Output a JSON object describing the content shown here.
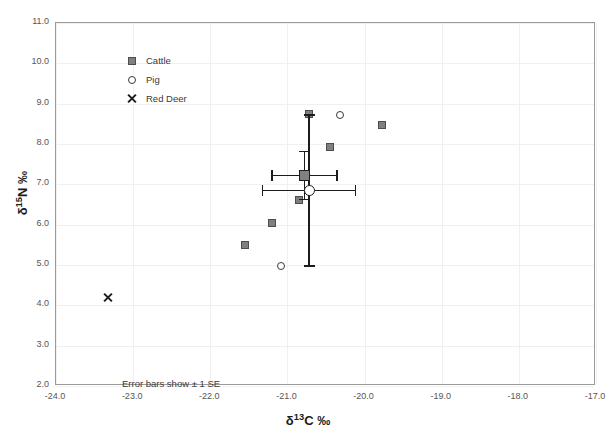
{
  "chart_data": {
    "type": "scatter",
    "title": "",
    "xlabel": "δ¹³C ‰",
    "ylabel": "δ¹⁵N ‰",
    "xlim": [
      -24.0,
      -17.0
    ],
    "ylim": [
      2.0,
      11.0
    ],
    "xticks": [
      "-24.0",
      "-23.0",
      "-22.0",
      "-21.0",
      "-20.0",
      "-19.0",
      "-18.0",
      "-17.0"
    ],
    "yticks": [
      "2.0",
      "3.0",
      "4.0",
      "5.0",
      "6.0",
      "7.0",
      "8.0",
      "9.0",
      "10.0",
      "11.0"
    ],
    "xtick_values": [
      -24.0,
      -23.0,
      -22.0,
      -21.0,
      -20.0,
      -19.0,
      -18.0,
      -17.0
    ],
    "ytick_values": [
      2.0,
      3.0,
      4.0,
      5.0,
      6.0,
      7.0,
      8.0,
      9.0,
      10.0,
      11.0
    ],
    "grid": true,
    "grid_color": "#f0f0f0",
    "legend_position": "top-left",
    "annotation": "Error bars show ± 1 SE",
    "series": [
      {
        "name": "Cattle",
        "marker": "filled-square",
        "color": "#808080",
        "edge_color": "#4d4d4d",
        "points": [
          {
            "x": -21.55,
            "y": 5.5
          },
          {
            "x": -21.2,
            "y": 6.05
          },
          {
            "x": -20.72,
            "y": 8.75
          },
          {
            "x": -20.45,
            "y": 7.92
          },
          {
            "x": -19.78,
            "y": 8.48
          },
          {
            "x": -20.85,
            "y": 6.62
          }
        ],
        "mean": {
          "x": -20.78,
          "y": 7.22,
          "x_err": 0.42,
          "y_err": 0.6
        }
      },
      {
        "name": "Pig",
        "marker": "open-circle",
        "color": "#ffffff",
        "edge_color": "#3a3a3a",
        "points": [
          {
            "x": -21.08,
            "y": 4.98
          },
          {
            "x": -20.32,
            "y": 8.72
          }
        ],
        "mean": {
          "x": -20.72,
          "y": 6.85,
          "x_err": 0.6,
          "y_err": 1.87
        }
      },
      {
        "name": "Red Deer",
        "marker": "cross-x",
        "color": "#1c1c1c",
        "edge_color": "#1c1c1c",
        "points": [
          {
            "x": -23.33,
            "y": 4.2
          }
        ],
        "mean": null
      }
    ]
  },
  "legend": {
    "items": [
      {
        "label": "Cattle",
        "marker": "filled-square"
      },
      {
        "label": "Pig",
        "marker": "open-circle"
      },
      {
        "label": "Red Deer",
        "marker": "cross-x"
      }
    ]
  },
  "axes": {
    "x_title_main": "δ",
    "x_title_sup": "13",
    "x_title_tail": "C ‰",
    "y_title_main": "δ",
    "y_title_sup": "15",
    "y_title_tail": "N ‰"
  },
  "annotation": {
    "text": "Error bars show ± 1 SE"
  }
}
